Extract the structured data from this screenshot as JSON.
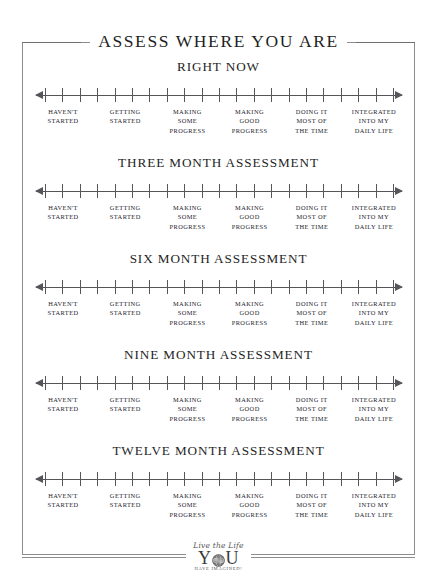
{
  "document": {
    "title": "ASSESS WHERE YOU ARE"
  },
  "scale": {
    "tick_count": 21,
    "left_arrow": "left-arrow",
    "right_arrow": "right-arrow",
    "anchors": [
      {
        "lines": [
          "HAVEN'T",
          "STARTED"
        ]
      },
      {
        "lines": [
          "GETTING",
          "STARTED"
        ]
      },
      {
        "lines": [
          "MAKING",
          "SOME",
          "PROGRESS"
        ]
      },
      {
        "lines": [
          "MAKING",
          "GOOD",
          "PROGRESS"
        ]
      },
      {
        "lines": [
          "DOING IT",
          "MOST OF",
          "THE TIME"
        ]
      },
      {
        "lines": [
          "INTEGRATED",
          "INTO MY",
          "DAILY LIFE"
        ]
      }
    ]
  },
  "sections": [
    {
      "heading": "RIGHT NOW"
    },
    {
      "heading": "THREE MONTH ASSESSMENT"
    },
    {
      "heading": "SIX MONTH ASSESSMENT"
    },
    {
      "heading": "NINE MONTH ASSESSMENT"
    },
    {
      "heading": "TWELVE MONTH ASSESSMENT"
    }
  ],
  "footer": {
    "logo_script": "Live the Life",
    "logo_word_left": "Y",
    "logo_word_right": "U",
    "logo_globe": "globe-icon",
    "logo_tagline": "HAVE IMAGINED!"
  },
  "colors": {
    "ink": "#2b2b2b",
    "rule": "#8d8d8d",
    "scale": "#55555a",
    "background": "#ffffff"
  }
}
